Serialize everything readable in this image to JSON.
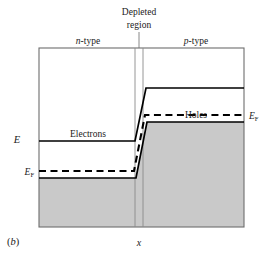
{
  "figure": {
    "panel_label": "(b)",
    "caption_note": "Energy band diagram of a p-n junction at equilibrium"
  },
  "axes": {
    "y_axis_label": "E",
    "x_axis_label": "x",
    "frame": {
      "left": 39,
      "top": 48,
      "right": 244,
      "bottom": 227
    },
    "frame_color": "#666666"
  },
  "annotations": {
    "depleted_region_line1": "Depleted",
    "depleted_region_line2": "region",
    "n_type": "n-type",
    "n_type_italic": "n",
    "n_type_rest": "-type",
    "p_type": "p-type",
    "p_type_italic": "p",
    "p_type_rest": "-type",
    "electrons": "Electrons",
    "holes": "Holes",
    "fermi_left": "E",
    "fermi_left_sub": "F",
    "fermi_right": "E",
    "fermi_right_sub": "F"
  },
  "colors": {
    "band_line": "#000000",
    "frame": "#6d6d6d",
    "fill_gray": "#c8c8c8",
    "fill_gray_edge": "#8a8a8a",
    "text": "#1a1a1a",
    "leader": "#808080"
  },
  "chart_data": {
    "type": "line",
    "xlabel": "x",
    "ylabel": "E",
    "xlim": [
      39,
      244
    ],
    "ylim_pixels": [
      48,
      227
    ],
    "grid": false,
    "legend": false,
    "regions": [
      {
        "name": "n-type",
        "x_start": 39,
        "x_end": 135
      },
      {
        "name": "Depleted region",
        "x_start": 135,
        "x_end": 143
      },
      {
        "name": "p-type",
        "x_start": 143,
        "x_end": 244
      }
    ],
    "series": [
      {
        "name": "Conduction band edge",
        "style": "solid",
        "width": 1.6,
        "points": [
          [
            39,
            141
          ],
          [
            135,
            141
          ],
          [
            146,
            88
          ],
          [
            244,
            88
          ]
        ]
      },
      {
        "name": "Valence band edge (top of filled states)",
        "style": "solid",
        "width": 1.6,
        "points": [
          [
            39,
            178
          ],
          [
            136,
            178
          ],
          [
            147,
            122
          ],
          [
            244,
            122
          ]
        ]
      },
      {
        "name": "Fermi level E_F",
        "style": "dashed",
        "width": 2.0,
        "points": [
          [
            39,
            171
          ],
          [
            134,
            171
          ],
          [
            145,
            115
          ],
          [
            244,
            115
          ]
        ]
      }
    ],
    "filled_areas": [
      {
        "name": "n-side valence band filled states",
        "fill": "#c8c8c8",
        "polygon": [
          [
            39,
            178
          ],
          [
            136,
            178
          ],
          [
            147,
            122
          ],
          [
            244,
            122
          ],
          [
            244,
            227
          ],
          [
            39,
            227
          ]
        ]
      }
    ],
    "markers": [
      {
        "name": "depletion-left-boundary",
        "type": "vline",
        "x": 135,
        "y_top": 48,
        "y_bottom": 227
      },
      {
        "name": "depletion-right-boundary",
        "type": "vline",
        "x": 143,
        "y_top": 48,
        "y_bottom": 227
      },
      {
        "name": "leader-line",
        "type": "vline",
        "x": 139,
        "y_top": 33,
        "y_bottom": 48
      }
    ],
    "text_labels": [
      {
        "text": "Electrons",
        "x": 88,
        "y": 135,
        "anchor": "middle"
      },
      {
        "text": "Holes",
        "x": 196,
        "y": 116,
        "anchor": "middle"
      },
      {
        "text": "n-type",
        "x": 88,
        "y": 42,
        "anchor": "middle"
      },
      {
        "text": "p-type",
        "x": 196,
        "y": 42,
        "anchor": "middle"
      },
      {
        "text": "Depleted",
        "x": 139,
        "y": 12,
        "anchor": "middle"
      },
      {
        "text": "region",
        "x": 139,
        "y": 25,
        "anchor": "middle"
      },
      {
        "text": "EF",
        "x": 33,
        "y": 172,
        "anchor": "end"
      },
      {
        "text": "EF",
        "x": 250,
        "y": 116,
        "anchor": "start"
      },
      {
        "text": "E",
        "x": 16,
        "y": 140,
        "anchor": "middle"
      },
      {
        "text": "x",
        "x": 139,
        "y": 243,
        "anchor": "middle"
      },
      {
        "text": "(b)",
        "x": 8,
        "y": 240,
        "anchor": "start"
      }
    ]
  }
}
